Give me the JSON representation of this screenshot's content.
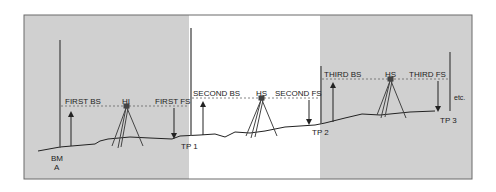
{
  "colors": {
    "panel_gray": "#d0d0d0",
    "panel_white": "#ffffff",
    "frame": "#6a6a6a",
    "line": "#333333",
    "dashed": "#666666"
  },
  "labels": {
    "first_bs": "FIRST BS",
    "hi": "HI",
    "first_fs": "FIRST FS",
    "second_bs": "SECOND BS",
    "hs_2": "HS",
    "second_fs": "SECOND FS",
    "third_bs": "THIRD BS",
    "hs_3": "HS",
    "third_fs": "THIRD FS",
    "etc": "etc.",
    "bm_line1": "BM",
    "bm_line2": "A",
    "tp1": "TP 1",
    "tp2": "TP 2",
    "tp3": "TP 3"
  }
}
